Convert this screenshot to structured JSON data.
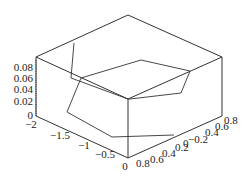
{
  "chart_data": {
    "type": "line3d",
    "title": "",
    "xlabel": "",
    "ylabel": "",
    "zlabel": "",
    "axes": {
      "x": {
        "ticks": [
          "-2",
          "-1.5",
          "-1",
          "-0.5",
          "0"
        ],
        "range": [
          -2,
          0
        ]
      },
      "y": {
        "ticks": [
          "0.8",
          "0.6",
          "0.4",
          "0.2",
          "0",
          "-0.2",
          "0.4",
          "0.6",
          "0.8"
        ],
        "range": [
          -0.8,
          0.8
        ]
      },
      "z": {
        "ticks": [
          "0",
          "0.02",
          "0.04",
          "0.06",
          "0.08"
        ],
        "range": [
          0,
          0.09
        ]
      }
    },
    "grid": false,
    "legend": null,
    "series": [
      {
        "name": "curve",
        "screen_points": [
          [
            74,
            43
          ],
          [
            71,
            78
          ],
          [
            128,
            99
          ],
          [
            130,
            99
          ],
          [
            181,
            93
          ],
          [
            190,
            71
          ],
          [
            141,
            60
          ],
          [
            81,
            78
          ],
          [
            67,
            112
          ],
          [
            112,
            137
          ],
          [
            174,
            135
          ]
        ]
      }
    ],
    "box": {
      "top": [
        128,
        15
      ],
      "left_top": [
        36,
        57
      ],
      "right_top": [
        222,
        57
      ],
      "front_top": [
        128,
        99
      ],
      "left_bottom": [
        36,
        116
      ],
      "front_bottom": [
        128,
        158
      ],
      "right_bottom": [
        222,
        116
      ]
    }
  },
  "labels": {
    "z": [
      {
        "t": "0.08",
        "x": 33,
        "y": 71
      },
      {
        "t": "0.06",
        "x": 33,
        "y": 82
      },
      {
        "t": "0.04",
        "x": 33,
        "y": 93
      },
      {
        "t": "0.02",
        "x": 33,
        "y": 105
      },
      {
        "t": "0",
        "x": 33,
        "y": 119
      }
    ],
    "x": [
      {
        "t": "−2",
        "x": 31,
        "y": 128
      },
      {
        "t": "−1.5",
        "x": 60,
        "y": 139
      },
      {
        "t": "−1",
        "x": 84,
        "y": 149
      },
      {
        "t": "−0.5",
        "x": 105,
        "y": 158
      },
      {
        "t": "0",
        "x": 125,
        "y": 170
      }
    ],
    "y": [
      {
        "t": "0.8",
        "x": 136,
        "y": 167
      },
      {
        "t": "0.6",
        "x": 150,
        "y": 163
      },
      {
        "t": "0.4",
        "x": 162,
        "y": 157
      },
      {
        "t": "0.2",
        "x": 175,
        "y": 151
      },
      {
        "t": "0",
        "x": 183,
        "y": 147
      },
      {
        "t": "−0.2",
        "x": 188,
        "y": 143
      },
      {
        "t": "0.4",
        "x": 205,
        "y": 136
      },
      {
        "t": "0.6",
        "x": 215,
        "y": 130
      },
      {
        "t": "0.8",
        "x": 224,
        "y": 124
      }
    ]
  }
}
